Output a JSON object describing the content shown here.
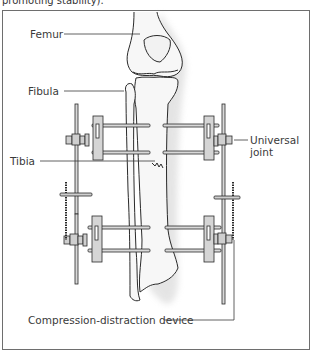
{
  "caption": "promoting stability).",
  "diagram": {
    "labels": {
      "femur": "Femur",
      "fibula": "Fibula",
      "tibia": "Tibia",
      "universal_joint_line1": "Universal",
      "universal_joint_line2": "joint",
      "device": "Compression-distraction device"
    },
    "colors": {
      "frame": "#6e6e6e",
      "line": "#2a2a2a",
      "bone_fill": "#f7f7f7",
      "metal": "#d9d9d9",
      "shadow": "#cfcfcf"
    }
  }
}
